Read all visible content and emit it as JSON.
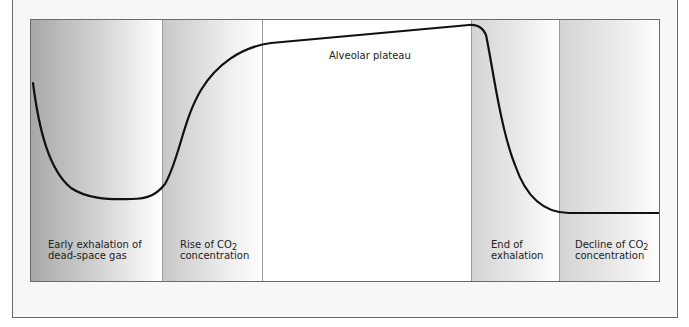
{
  "diagram": {
    "type": "capnogram",
    "curve_color": "#111111",
    "phases": [
      {
        "id": "early-exhalation",
        "label_line1": "Early exhalation of",
        "label_line2": "dead-space gas",
        "shading": "dark"
      },
      {
        "id": "rise-co2",
        "label_line1_prefix": "Rise of CO",
        "label_line1_sub": "2",
        "label_line2": "concentration",
        "shading": "mid"
      },
      {
        "id": "alveolar-plateau",
        "label": "Alveolar plateau",
        "shading": "none"
      },
      {
        "id": "end-exhalation",
        "label_line1": "End of",
        "label_line2": "exhalation",
        "shading": "light"
      },
      {
        "id": "decline-co2",
        "label_line1_prefix": "Decline of CO",
        "label_line1_sub": "2",
        "label_line2": "concentration",
        "shading": "light"
      }
    ]
  }
}
